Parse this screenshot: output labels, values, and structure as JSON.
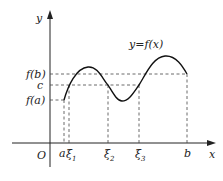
{
  "diagram": {
    "type": "function graph illustrating intermediate value theorem",
    "curve_label": "y=f(x)",
    "axes": {
      "x_label": "x",
      "y_label": "y",
      "origin_label": "O"
    },
    "y_ticks": [
      {
        "label": "f(b)",
        "y": 74
      },
      {
        "label": "c",
        "y": 85
      },
      {
        "label": "f(a)",
        "y": 100
      }
    ],
    "x_ticks": [
      {
        "label": "a",
        "sub": "",
        "x": 64
      },
      {
        "label": "ξ",
        "sub": "1",
        "x": 69
      },
      {
        "label": "ξ",
        "sub": "2",
        "x": 108
      },
      {
        "label": "ξ",
        "sub": "3",
        "x": 139
      },
      {
        "label": "b",
        "sub": "",
        "x": 187
      }
    ],
    "colors": {
      "line": "#222222",
      "dashed": "#444444",
      "background": "#ffffff"
    }
  }
}
